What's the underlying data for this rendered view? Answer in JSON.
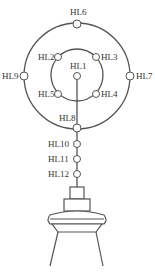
{
  "diagram": {
    "type": "lamp-wiring-diagram",
    "colors": {
      "line": "#555555",
      "node_fill": "#ffffff",
      "text": "#333333"
    },
    "nodes": [
      {
        "id": "HL1",
        "label": "HL1",
        "x": 77,
        "y": 68
      },
      {
        "id": "HL2",
        "label": "HL2",
        "x": 57,
        "y": 57
      },
      {
        "id": "HL3",
        "label": "HL3",
        "x": 97,
        "y": 57
      },
      {
        "id": "HL4",
        "label": "HL4",
        "x": 97,
        "y": 93
      },
      {
        "id": "HL5",
        "label": "HL5",
        "x": 57,
        "y": 93
      },
      {
        "id": "HL6",
        "label": "HL6",
        "x": 77,
        "y": 23
      },
      {
        "id": "HL7",
        "label": "HL7",
        "x": 130,
        "y": 76
      },
      {
        "id": "HL8",
        "label": "HL8",
        "x": 77,
        "y": 129
      },
      {
        "id": "HL9",
        "label": "HL9",
        "x": 24,
        "y": 76
      },
      {
        "id": "HL10",
        "label": "HL10",
        "x": 77,
        "y": 144
      },
      {
        "id": "HL11",
        "label": "HL11",
        "x": 77,
        "y": 159
      },
      {
        "id": "HL12",
        "label": "HL12",
        "x": 77,
        "y": 174
      }
    ],
    "outer_ring": {
      "cx": 77,
      "cy": 76,
      "r": 53
    },
    "inner_ring": {
      "cx": 77,
      "cy": 75,
      "r": 26
    },
    "labels": {
      "HL1": "HL1",
      "HL2": "HL2",
      "HL3": "HL3",
      "HL4": "HL4",
      "HL5": "HL5",
      "HL6": "HL6",
      "HL7": "HL7",
      "HL8": "HL8",
      "HL9": "HL9",
      "HL10": "HL10",
      "HL11": "HL11",
      "HL12": "HL12"
    }
  }
}
